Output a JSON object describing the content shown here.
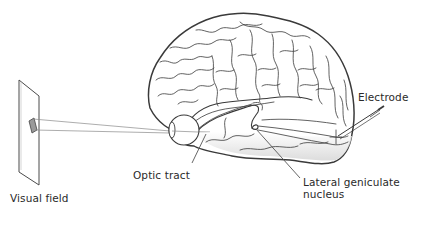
{
  "figure": {
    "labels": {
      "visual_field": "Visual field",
      "optic_tract": "Optic tract",
      "lateral_geniculate_line1": "Lateral geniculate",
      "lateral_geniculate_line2": "nucleus",
      "electrode": "Electrode"
    },
    "colors": {
      "line": "#3a3a3a",
      "ray": "#8a8a8a",
      "shading": "#d8d8d8",
      "background": "#ffffff",
      "text": "#2a2a2a"
    },
    "elements": [
      {
        "name": "visual-field-screen",
        "shape": "parallelogram"
      },
      {
        "name": "stimulus",
        "shape": "small rotated rectangle"
      },
      {
        "name": "light-rays",
        "count": 2
      },
      {
        "name": "eye",
        "shape": "circle"
      },
      {
        "name": "brain",
        "view": "lateral"
      },
      {
        "name": "optic-tract"
      },
      {
        "name": "lateral-geniculate-nucleus"
      },
      {
        "name": "optic-radiation"
      },
      {
        "name": "electrode",
        "target": "visual cortex"
      }
    ]
  }
}
